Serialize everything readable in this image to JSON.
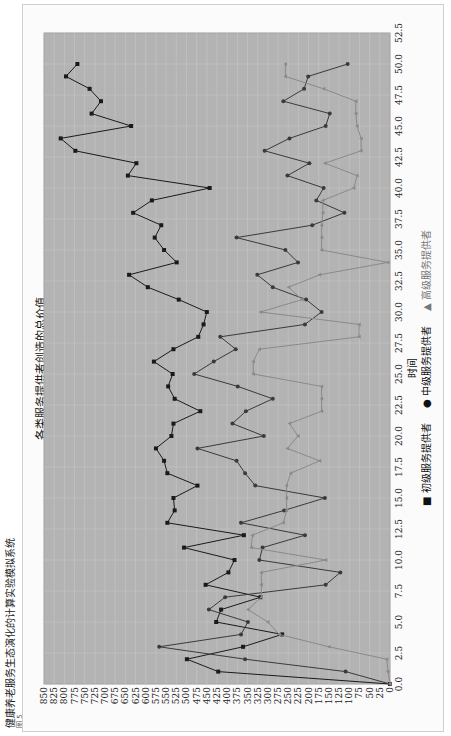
{
  "app": {
    "title": "健康养老服务生态演化的计算实验模拟系统",
    "subtitle": "图 5"
  },
  "chart_data": {
    "type": "line",
    "title": "各类服务提供者创造的总价值",
    "xlabel": "时间",
    "ylabel": "",
    "xlim": [
      0,
      52.5
    ],
    "ylim": [
      0,
      850
    ],
    "x_ticks": [
      "0.0",
      "2.5",
      "5.0",
      "7.5",
      "10.0",
      "12.5",
      "15.0",
      "17.5",
      "20.0",
      "22.5",
      "25.0",
      "27.5",
      "30.0",
      "32.5",
      "35.0",
      "37.5",
      "40.0",
      "42.5",
      "45.0",
      "47.5",
      "50.0",
      "52.5"
    ],
    "y_ticks": [
      "0",
      "25",
      "50",
      "75",
      "100",
      "125",
      "150",
      "175",
      "200",
      "225",
      "250",
      "275",
      "300",
      "325",
      "350",
      "375",
      "400",
      "425",
      "450",
      "475",
      "500",
      "525",
      "550",
      "575",
      "600",
      "625",
      "650",
      "675",
      "700",
      "725",
      "750",
      "775",
      "800",
      "825",
      "850"
    ],
    "grid": true,
    "legend_position": "bottom",
    "x": [
      0,
      1,
      2,
      3,
      4,
      5,
      6,
      7,
      8,
      9,
      10,
      11,
      12,
      13,
      14,
      15,
      16,
      17,
      18,
      19,
      20,
      21,
      22,
      23,
      24,
      25,
      26,
      27,
      28,
      29,
      30,
      31,
      32,
      33,
      34,
      35,
      36,
      37,
      38,
      39,
      40,
      41,
      42,
      43,
      44,
      45,
      46,
      47,
      48,
      49,
      50
    ],
    "series": [
      {
        "name": "初级服务提供者",
        "marker": "square",
        "color": "#1a1a1a",
        "values": [
          0,
          422,
          499,
          361,
          265,
          427,
          415,
          318,
          453,
          397,
          382,
          506,
          359,
          547,
          529,
          532,
          473,
          547,
          555,
          575,
          537,
          532,
          466,
          529,
          545,
          534,
          580,
          532,
          471,
          458,
          450,
          519,
          595,
          641,
          524,
          555,
          578,
          562,
          631,
          585,
          443,
          644,
          623,
          773,
          809,
          636,
          733,
          710,
          738,
          796,
          768
        ]
      },
      {
        "name": "中级服务提供者",
        "marker": "circle",
        "color": "#3a3a3a",
        "values": [
          0,
          109,
          356,
          567,
          366,
          349,
          445,
          405,
          158,
          122,
          321,
          313,
          209,
          366,
          260,
          160,
          331,
          356,
          377,
          473,
          310,
          387,
          354,
          288,
          374,
          481,
          433,
          379,
          417,
          209,
          168,
          206,
          288,
          326,
          226,
          257,
          377,
          191,
          112,
          181,
          163,
          252,
          198,
          308,
          247,
          158,
          148,
          262,
          211,
          201,
          104
        ]
      },
      {
        "name": "高级服务提供者",
        "marker": "triangle",
        "color": "#8a8a8a",
        "values": [
          0,
          5,
          8,
          150,
          272,
          300,
          349,
          316,
          316,
          316,
          158,
          341,
          338,
          262,
          254,
          254,
          254,
          244,
          173,
          252,
          226,
          247,
          168,
          168,
          168,
          336,
          336,
          321,
          76,
          76,
          318,
          216,
          249,
          173,
          5,
          168,
          168,
          168,
          165,
          165,
          89,
          81,
          160,
          71,
          71,
          81,
          84,
          84,
          163,
          257,
          257
        ]
      }
    ]
  },
  "legend": {
    "items": [
      {
        "label": "初级服务提供者",
        "marker": "■"
      },
      {
        "label": "中级服务提供者",
        "marker": "●"
      },
      {
        "label": "高级服务提供者",
        "marker": "▲"
      }
    ]
  },
  "colors": {
    "plot_bg": "#b3b3b3",
    "grid": "#c8c8c8",
    "panel_bg": "#fbfbfb"
  }
}
